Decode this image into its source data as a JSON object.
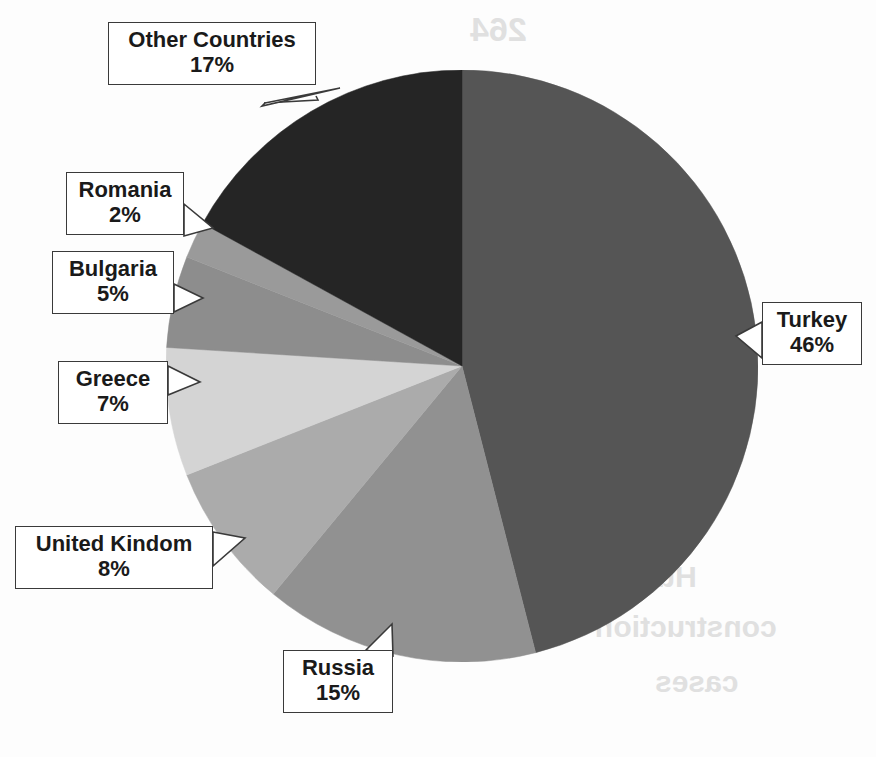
{
  "chart_data": {
    "type": "pie",
    "title": "",
    "subtitle": "",
    "xlabel": "",
    "ylabel": "",
    "legend_position": "none",
    "labels_position": "callout-boxes",
    "start_angle_deg": 0,
    "direction": "clockwise",
    "categories": [
      "Turkey",
      "Russia",
      "United Kindom",
      "Greece",
      "Bulgaria",
      "Romania",
      "Other Countries"
    ],
    "values": [
      46,
      15,
      8,
      7,
      5,
      2,
      17
    ],
    "value_unit": "%",
    "colors": [
      "#555555",
      "#919191",
      "#ababab",
      "#d4d4d4",
      "#8d8d8d",
      "#9a9a9a",
      "#252525"
    ],
    "slices": [
      {
        "label": "Turkey",
        "value": 46,
        "percent_text": "46%",
        "color": "#555555"
      },
      {
        "label": "Russia",
        "value": 15,
        "percent_text": "15%",
        "color": "#919191"
      },
      {
        "label": "United Kindom",
        "value": 8,
        "percent_text": "8%",
        "color": "#ababab"
      },
      {
        "label": "Greece",
        "value": 7,
        "percent_text": "7%",
        "color": "#d4d4d4"
      },
      {
        "label": "Bulgaria",
        "value": 5,
        "percent_text": "5%",
        "color": "#8d8d8d"
      },
      {
        "label": "Romania",
        "value": 2,
        "percent_text": "2%",
        "color": "#9a9a9a"
      },
      {
        "label": "Other Countries",
        "value": 17,
        "percent_text": "17%",
        "color": "#252525"
      }
    ]
  },
  "callouts": {
    "other": {
      "label": "Other Countries",
      "percent": "17%"
    },
    "romania": {
      "label": "Romania",
      "percent": "2%"
    },
    "bulgaria": {
      "label": "Bulgaria",
      "percent": "5%"
    },
    "greece": {
      "label": "Greece",
      "percent": "7%"
    },
    "uk": {
      "label": "United Kindom",
      "percent": "8%"
    },
    "russia": {
      "label": "Russia",
      "percent": "15%"
    },
    "turkey": {
      "label": "Turkey",
      "percent": "46%"
    }
  },
  "artifacts": {
    "note": "faint reverse-side scan bleed-through",
    "top": "264",
    "mid_right": "Hull",
    "lower_right": "construction",
    "bottom_right": "cases"
  }
}
